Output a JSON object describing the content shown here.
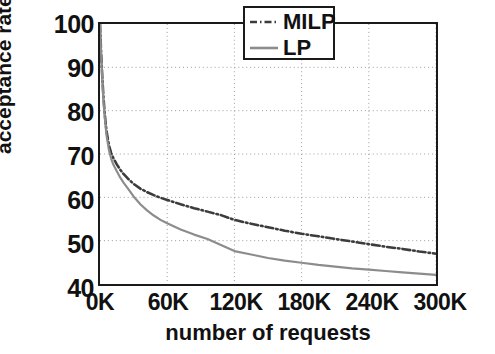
{
  "chart_data": {
    "type": "line",
    "title": "",
    "xlabel": "number of requests",
    "ylabel": "acceptance rate (%)",
    "xlim": [
      0,
      300000
    ],
    "ylim": [
      40,
      100
    ],
    "x_tick_labels": [
      "0K",
      "60K",
      "120K",
      "180K",
      "240K",
      "300K"
    ],
    "x_tick_values": [
      0,
      60000,
      120000,
      180000,
      240000,
      300000
    ],
    "y_tick_labels": [
      "40",
      "50",
      "60",
      "70",
      "80",
      "90",
      "100"
    ],
    "y_tick_values": [
      40,
      50,
      60,
      70,
      80,
      90,
      100
    ],
    "grid": true,
    "grid_style": "dotted",
    "legend_position": "top-right",
    "x": [
      0,
      1000,
      2000,
      3000,
      4000,
      5000,
      6000,
      8000,
      10000,
      12000,
      15000,
      18000,
      21000,
      25000,
      30000,
      36000,
      42000,
      48000,
      54000,
      60000,
      72000,
      84000,
      96000,
      108000,
      120000,
      135000,
      150000,
      165000,
      180000,
      195000,
      210000,
      225000,
      240000,
      255000,
      270000,
      285000,
      300000
    ],
    "series": [
      {
        "name": "MILP",
        "style": "dash-dot",
        "color": "#3c3c3c",
        "values": [
          100,
          93.5,
          88.0,
          83.5,
          80.0,
          77.2,
          75.0,
          72.0,
          70.2,
          69.0,
          67.6,
          66.4,
          65.4,
          64.3,
          63.1,
          62.0,
          61.2,
          60.5,
          59.9,
          59.4,
          58.4,
          57.5,
          56.7,
          55.9,
          54.8,
          53.9,
          53.1,
          52.3,
          51.6,
          51.0,
          50.4,
          49.8,
          49.2,
          48.6,
          48.1,
          47.5,
          47.0
        ]
      },
      {
        "name": "LP",
        "style": "solid",
        "color": "#8c8c8c",
        "values": [
          100,
          93.2,
          87.4,
          82.8,
          79.2,
          76.3,
          74.0,
          70.9,
          68.9,
          67.5,
          66.0,
          64.6,
          63.4,
          62.0,
          60.2,
          58.4,
          57.0,
          55.8,
          54.8,
          54.0,
          52.6,
          51.4,
          50.4,
          49.0,
          47.6,
          46.8,
          46.0,
          45.4,
          44.9,
          44.4,
          44.0,
          43.6,
          43.3,
          43.0,
          42.7,
          42.4,
          42.1
        ]
      }
    ],
    "annotations": []
  },
  "legend": {
    "items": [
      {
        "label": "MILP",
        "sample": "dash-dot-line-swatch"
      },
      {
        "label": "LP",
        "sample": "solid-line-swatch"
      }
    ]
  },
  "colors": {
    "axis": "#1a1a1a",
    "grid": "#9a9a9a",
    "milp": "#3c3c3c",
    "lp": "#8c8c8c",
    "background": "#ffffff",
    "text": "#111111"
  }
}
